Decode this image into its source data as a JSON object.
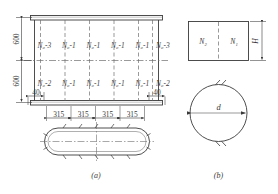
{
  "figure": {
    "caption_a": "(a)",
    "caption_b": "(b)"
  },
  "view_a": {
    "vertical_dims": [
      "600",
      "600"
    ],
    "edge_dims": [
      "40",
      "40"
    ],
    "spacing_chain": [
      "315",
      "315",
      "315",
      "315"
    ],
    "top_row_labels": [
      "N₀-3",
      "N₀-1",
      "N₀-1",
      "N₀-1",
      "N₀-1",
      "N₀-3"
    ],
    "bottom_row_labels": [
      "N₀-2",
      "N₀-1",
      "N₀-1",
      "N₀-1",
      "N₀-1",
      "N₀-2"
    ]
  },
  "view_b": {
    "rect_labels": [
      "N₂",
      "N₁"
    ],
    "height_label": "H",
    "diameter_label": "d"
  },
  "colors": {
    "line": "#3a3a3a",
    "dash": "#6e6e6e",
    "text": "#3a3a3a",
    "background": "#ffffff"
  }
}
